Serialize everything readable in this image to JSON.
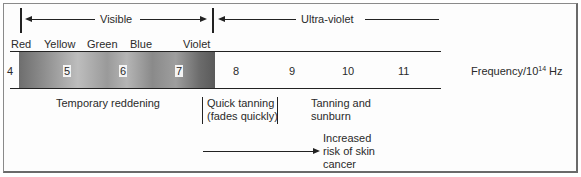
{
  "diagram": {
    "regions": {
      "visible_label": "Visible",
      "ultraviolet_label": "Ultra-violet"
    },
    "colors": [
      "Red",
      "Yellow",
      "Green",
      "Blue",
      "Violet"
    ],
    "ticks": [
      "4",
      "5",
      "6",
      "7",
      "8",
      "9",
      "10",
      "11"
    ],
    "axis_label_prefix": "Frequency/10",
    "axis_label_exponent": "14",
    "axis_label_suffix": " Hz",
    "effects": {
      "temporary_reddening": "Temporary reddening",
      "quick_tanning_line1": "Quick tanning",
      "quick_tanning_line2": "(fades quickly)",
      "tanning_sunburn_line1": "Tanning and",
      "tanning_sunburn_line2": "sunburn",
      "cancer_line1": "Increased",
      "cancer_line2": "risk of skin",
      "cancer_line3": "cancer"
    },
    "palette": {
      "ink": "#222222",
      "spectrum_dark": "#5a5a5a",
      "spectrum_light": "#bdbdbd"
    }
  }
}
